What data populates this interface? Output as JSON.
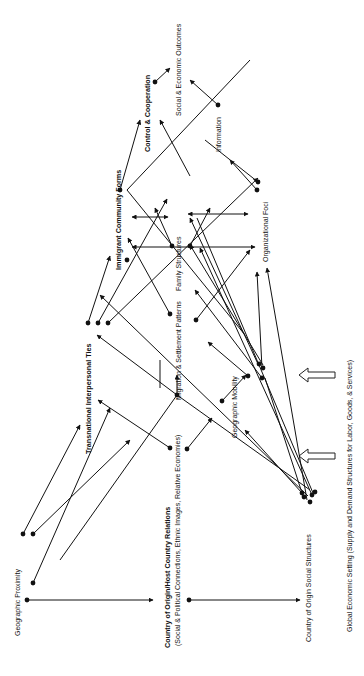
{
  "diagram": {
    "orientation": "rotated-90-ccw",
    "nodes": {
      "geographic_proximity": "Geographic Proximity",
      "country_relations_title": "Country of Origin/Host Country Relations",
      "country_relations_sub": "(Social & Political Connections, Ethnic Images, Relative Economies)",
      "transnational_ties": "Transnational Interpersonal Ties",
      "immigrant_forms": "Immigrant Community Forms",
      "control_cooperation": "Control & Cooperation",
      "social_economic_outcomes": "Social & Economic Outcomes",
      "information": "Information",
      "family_structures": "Family Structures",
      "organizational_foci": "Organizational Foci",
      "migration_settlement": "Migration & Settlement Patterns",
      "geographic_mobility": "Geographic Mobility",
      "country_origin_social": "Country of Origin Social Structures",
      "global_setting": "Global Economic Setting (Supply and Demand Structures for Labor, Goods, & Services)"
    },
    "colors": {
      "ink": "#111111",
      "background": "#ffffff"
    }
  }
}
